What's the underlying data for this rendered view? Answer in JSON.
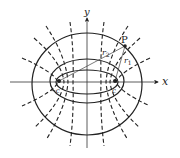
{
  "diagram": {
    "labels": {
      "x_axis": "x",
      "y_axis": "y",
      "point": "P",
      "r1": "r",
      "r1_sub": "1",
      "r2": "r",
      "r2_sub": "2",
      "focus_left": "−c",
      "focus_right": "c"
    },
    "colors": {
      "stroke": "#222222",
      "background": "#ffffff"
    },
    "geometry": {
      "center": [
        87,
        82
      ],
      "foci": [
        [
          59,
          81
        ],
        [
          115,
          81
        ]
      ],
      "ellipses": [
        {
          "rx": 55,
          "ry": 51
        },
        {
          "rx": 37,
          "ry": 22
        },
        {
          "rx": 31,
          "ry": 12
        }
      ],
      "point_P": [
        125,
        46
      ]
    }
  }
}
